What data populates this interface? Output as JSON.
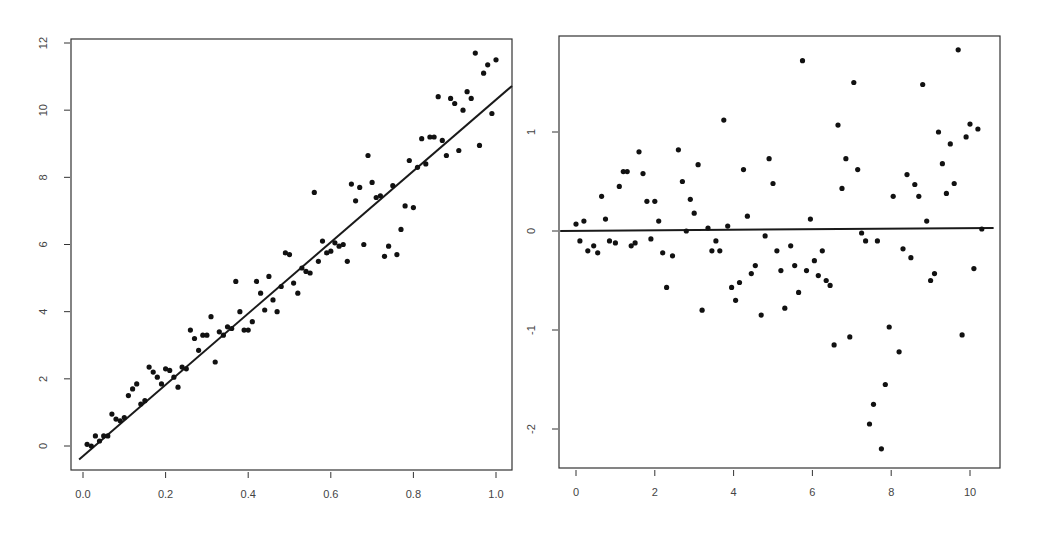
{
  "chart_data": [
    {
      "type": "scatter",
      "title": "",
      "xlabel": "",
      "ylabel": "",
      "xlim": [
        -0.03,
        1.04
      ],
      "ylim": [
        -0.4,
        12.1
      ],
      "xticks": [
        0.0,
        0.2,
        0.4,
        0.6,
        0.8,
        1.0
      ],
      "xtick_labels": [
        "0.0",
        "0.2",
        "0.4",
        "0.6",
        "0.8",
        "1.0"
      ],
      "yticks": [
        0,
        2,
        4,
        6,
        8,
        10,
        12
      ],
      "ytick_labels": [
        "0",
        "2",
        "4",
        "6",
        "8",
        "10",
        "12"
      ],
      "grid": false,
      "fit_line": {
        "intercept": -0.3,
        "slope": 10.6
      },
      "series": [
        {
          "name": "observations",
          "x": [
            0.01,
            0.02,
            0.03,
            0.04,
            0.05,
            0.06,
            0.07,
            0.08,
            0.09,
            0.1,
            0.11,
            0.12,
            0.13,
            0.14,
            0.15,
            0.16,
            0.17,
            0.18,
            0.19,
            0.2,
            0.21,
            0.22,
            0.23,
            0.24,
            0.25,
            0.26,
            0.27,
            0.28,
            0.29,
            0.3,
            0.31,
            0.32,
            0.33,
            0.34,
            0.35,
            0.36,
            0.37,
            0.38,
            0.39,
            0.4,
            0.41,
            0.42,
            0.43,
            0.44,
            0.45,
            0.46,
            0.47,
            0.48,
            0.49,
            0.5,
            0.51,
            0.52,
            0.53,
            0.54,
            0.55,
            0.56,
            0.57,
            0.58,
            0.59,
            0.6,
            0.61,
            0.62,
            0.63,
            0.64,
            0.65,
            0.66,
            0.67,
            0.68,
            0.69,
            0.7,
            0.71,
            0.72,
            0.73,
            0.74,
            0.75,
            0.76,
            0.77,
            0.78,
            0.79,
            0.8,
            0.81,
            0.82,
            0.83,
            0.84,
            0.85,
            0.86,
            0.87,
            0.88,
            0.89,
            0.9,
            0.91,
            0.92,
            0.93,
            0.94,
            0.95,
            0.96,
            0.97,
            0.98,
            0.99,
            1.0
          ],
          "y": [
            0.05,
            0.0,
            0.3,
            0.15,
            0.3,
            0.3,
            0.95,
            0.8,
            0.75,
            0.85,
            1.5,
            1.7,
            1.85,
            1.25,
            1.35,
            2.35,
            2.2,
            2.05,
            1.85,
            2.3,
            2.25,
            2.05,
            1.75,
            2.35,
            2.3,
            3.45,
            3.2,
            2.85,
            3.3,
            3.3,
            3.85,
            2.5,
            3.4,
            3.3,
            3.55,
            3.5,
            4.9,
            4.0,
            3.45,
            3.45,
            3.7,
            4.9,
            4.55,
            4.05,
            5.05,
            4.35,
            4.0,
            4.75,
            5.75,
            5.7,
            4.85,
            4.55,
            5.3,
            5.2,
            5.15,
            7.55,
            5.5,
            6.1,
            5.75,
            5.8,
            6.05,
            5.95,
            6.0,
            5.5,
            7.8,
            7.3,
            7.7,
            6.0,
            8.65,
            7.85,
            7.4,
            7.45,
            5.65,
            5.95,
            7.75,
            5.7,
            6.45,
            7.15,
            8.5,
            7.1,
            8.3,
            9.15,
            8.4,
            9.2,
            9.2,
            10.4,
            9.1,
            8.65,
            10.35,
            10.2,
            8.8,
            10.0,
            10.55,
            10.35,
            11.7,
            8.95,
            11.1,
            11.35,
            9.9,
            11.5
          ]
        }
      ]
    },
    {
      "type": "scatter",
      "title": "",
      "xlabel": "",
      "ylabel": "",
      "xlim": [
        -0.4,
        10.6
      ],
      "ylim": [
        -2.4,
        1.95
      ],
      "xticks": [
        0,
        2,
        4,
        6,
        8,
        10
      ],
      "xtick_labels": [
        "0",
        "2",
        "4",
        "6",
        "8",
        "10"
      ],
      "yticks": [
        -2,
        -1,
        0,
        1
      ],
      "ytick_labels": [
        "-2",
        "-1",
        "0",
        "1"
      ],
      "grid": false,
      "fit_line": {
        "intercept": 0.0,
        "slope": 0.003
      },
      "series": [
        {
          "name": "residuals",
          "x": [
            0.0,
            0.1,
            0.2,
            0.3,
            0.45,
            0.55,
            0.65,
            0.75,
            0.85,
            1.0,
            1.1,
            1.2,
            1.3,
            1.4,
            1.5,
            1.6,
            1.7,
            1.8,
            1.9,
            2.0,
            2.1,
            2.2,
            2.3,
            2.45,
            2.6,
            2.7,
            2.8,
            2.9,
            3.0,
            3.1,
            3.2,
            3.35,
            3.45,
            3.55,
            3.65,
            3.75,
            3.85,
            3.95,
            4.05,
            4.15,
            4.25,
            4.35,
            4.45,
            4.55,
            4.7,
            4.8,
            4.9,
            5.0,
            5.1,
            5.2,
            5.3,
            5.45,
            5.55,
            5.65,
            5.75,
            5.85,
            5.95,
            6.05,
            6.15,
            6.25,
            6.35,
            6.45,
            6.55,
            6.65,
            6.75,
            6.85,
            6.95,
            7.05,
            7.15,
            7.25,
            7.35,
            7.45,
            7.55,
            7.65,
            7.75,
            7.85,
            7.95,
            8.05,
            8.2,
            8.3,
            8.4,
            8.5,
            8.6,
            8.7,
            8.8,
            8.9,
            9.0,
            9.1,
            9.2,
            9.3,
            9.4,
            9.5,
            9.6,
            9.7,
            9.8,
            9.9,
            10.0,
            10.1,
            10.2,
            10.3
          ],
          "y": [
            0.07,
            -0.1,
            0.1,
            -0.2,
            -0.15,
            -0.22,
            0.35,
            0.12,
            -0.1,
            -0.12,
            0.45,
            0.6,
            0.6,
            -0.15,
            -0.12,
            0.8,
            0.58,
            0.3,
            -0.08,
            0.3,
            0.1,
            -0.22,
            -0.57,
            -0.25,
            0.82,
            0.5,
            0.0,
            0.32,
            0.18,
            0.67,
            -0.8,
            0.03,
            -0.2,
            -0.1,
            -0.2,
            1.12,
            0.05,
            -0.57,
            -0.7,
            -0.52,
            0.62,
            0.15,
            -0.43,
            -0.35,
            -0.85,
            -0.05,
            0.73,
            0.48,
            -0.2,
            -0.4,
            -0.78,
            -0.15,
            -0.35,
            -0.62,
            1.72,
            -0.4,
            0.12,
            -0.3,
            -0.45,
            -0.2,
            -0.5,
            -0.55,
            -1.15,
            1.07,
            0.43,
            0.73,
            -1.07,
            1.5,
            0.62,
            -0.02,
            -0.1,
            -1.95,
            -1.75,
            -0.1,
            -2.2,
            -1.55,
            -0.97,
            0.35,
            -1.22,
            -0.18,
            0.57,
            -0.27,
            0.47,
            0.35,
            1.48,
            0.1,
            -0.5,
            -0.43,
            1.0,
            0.68,
            0.38,
            0.88,
            0.48,
            1.83,
            -1.05,
            0.95,
            1.08,
            -0.38,
            1.03,
            0.02
          ]
        }
      ]
    }
  ]
}
